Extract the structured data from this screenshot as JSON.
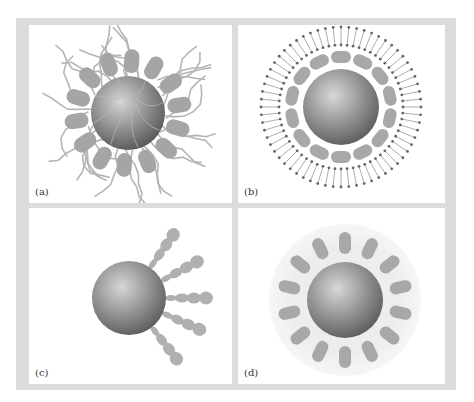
{
  "figure": {
    "panels": [
      {
        "id": "a",
        "label": "(a)",
        "description": "Sphere surrounded by ring of blobs with tangled polymer chains"
      },
      {
        "id": "b",
        "label": "(b)",
        "description": "Sphere with blob ring enclosed by lipid bilayer (radial dotted lines)"
      },
      {
        "id": "c",
        "label": "(c)",
        "description": "Sphere with five tapering chains radiating to the right"
      },
      {
        "id": "d",
        "label": "(d)",
        "description": "Sphere surrounded by ring of blobs inside a light halo"
      }
    ]
  },
  "colors": {
    "frame": "#dcdcdc",
    "panel_bg": "#ffffff",
    "sphere_light": "#d8d8d8",
    "sphere_dark": "#5a5a5a",
    "blob": "#a8a8a8",
    "chain": "#b0b0b0",
    "lipid": "#707070",
    "halo": "#ececec"
  }
}
